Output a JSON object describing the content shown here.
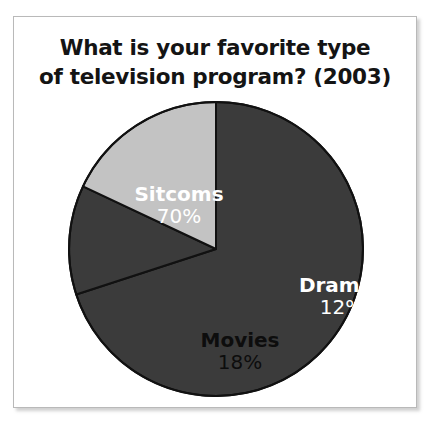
{
  "figure": {
    "title_line_1": "What is your favorite type",
    "title_line_2": "of television program? (2003)"
  },
  "chart_data": {
    "type": "pie",
    "title": "What is your favorite type of television program? (2003)",
    "xlabel": "",
    "ylabel": "",
    "legend": "none",
    "grid": false,
    "units": "percent",
    "start_angle_deg": 0,
    "direction": "clockwise",
    "categories": [
      "Sitcoms",
      "Dramas",
      "Movies"
    ],
    "values": [
      70,
      12,
      18
    ],
    "labels": [
      "70%",
      "12%",
      "18%"
    ],
    "colors": [
      "#3b3b3b",
      "#3b3b3b",
      "#c3c3c3"
    ],
    "label_colors": [
      "#ffffff",
      "#ffffff",
      "#0d0d0d"
    ],
    "slices": [
      {
        "name": "Sitcoms",
        "value": 70,
        "label": "70%",
        "color": "#3b3b3b",
        "text_color": "#ffffff"
      },
      {
        "name": "Dramas",
        "value": 12,
        "label": "12%",
        "color": "#3b3b3b",
        "text_color": "#ffffff"
      },
      {
        "name": "Movies",
        "value": 18,
        "label": "18%",
        "color": "#c3c3c3",
        "text_color": "#0d0d0d"
      }
    ],
    "geometry": {
      "center_x": 202,
      "center_y": 232,
      "radius": 147,
      "outline_color": "#111111",
      "outline_width": 2
    }
  }
}
